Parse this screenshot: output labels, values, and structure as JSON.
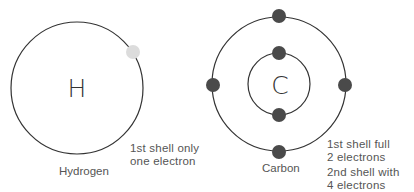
{
  "atoms": [
    {
      "name": "Hydrogen",
      "symbol": "H",
      "center": [
        77,
        88
      ],
      "shells": [
        {
          "radius": 66,
          "electrons": [
            [
              133,
              52
            ]
          ]
        }
      ],
      "electron_color": "#dcdcdc",
      "note_lines": [
        "1st shell only",
        "one electron"
      ]
    },
    {
      "name": "Carbon",
      "symbol": "C",
      "center": [
        279,
        84
      ],
      "shells": [
        {
          "radius": 31,
          "electrons": [
            [
              279,
              53
            ],
            [
              279,
              115
            ]
          ]
        },
        {
          "radius": 67,
          "electrons": [
            [
              279,
              16
            ],
            [
              213,
              85
            ],
            [
              345,
              85
            ],
            [
              279,
              152
            ]
          ]
        }
      ],
      "electron_color": "#4a4a4a",
      "note_lines": [
        "1st shell full",
        "2 electrons",
        "2nd shell with",
        "4 electrons"
      ]
    }
  ],
  "colors": {
    "shell_stroke": "#333333",
    "text": "#555555"
  }
}
